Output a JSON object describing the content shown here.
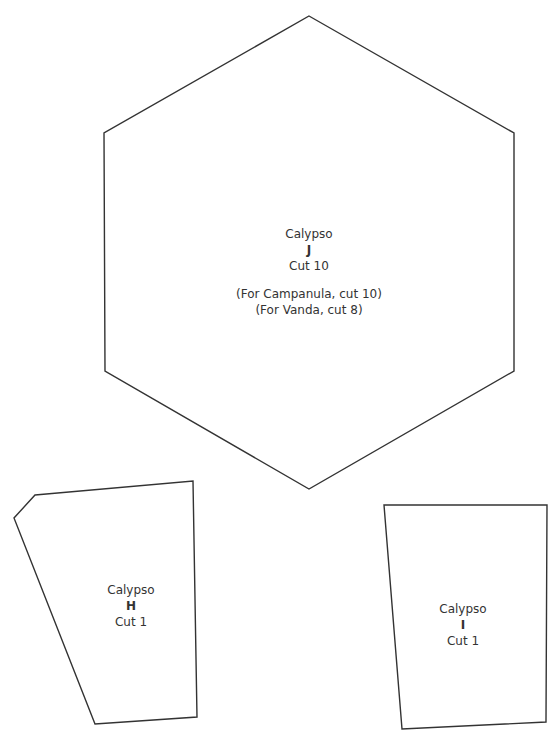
{
  "colors": {
    "background": "#ffffff",
    "stroke": "#333333",
    "text": "#333333"
  },
  "pieces": [
    {
      "id": "J",
      "pattern": "Calypso",
      "letter": "J",
      "cut": "Cut 10",
      "notes": [
        "(For Campanula, cut 10)",
        "(For Vanda, cut 8)"
      ],
      "shape": "hexagon",
      "points": "309,16 514,133 514,371 309,489 105,371 104,133"
    },
    {
      "id": "H",
      "pattern": "Calypso",
      "letter": "H",
      "cut": "Cut 1",
      "notes": [],
      "shape": "irregular-pentagon",
      "points": "35,495 193,481 197,717 95,724 14,518"
    },
    {
      "id": "I",
      "pattern": "Calypso",
      "letter": "I",
      "cut": "Cut 1",
      "notes": [],
      "shape": "trapezoid",
      "points": "384,505 547,505 546,722 402,729"
    }
  ]
}
